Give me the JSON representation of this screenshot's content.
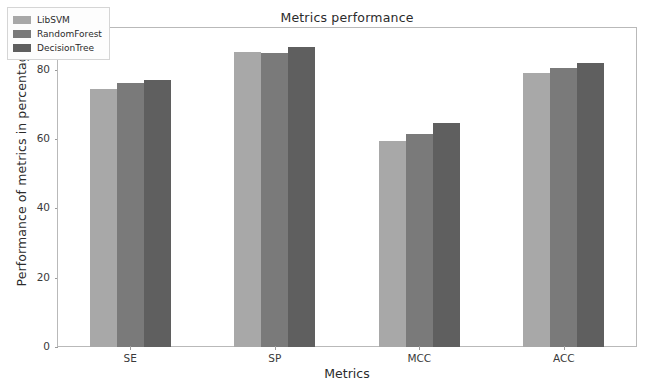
{
  "chart_data": {
    "type": "bar",
    "title": "Metrics performance",
    "xlabel": "Metrics",
    "ylabel": "Performance of metrics in percentage",
    "categories": [
      "SE",
      "SP",
      "MCC",
      "ACC"
    ],
    "series": [
      {
        "name": "LibSVM",
        "color": "#a8a8a8",
        "values": [
          74.5,
          85.0,
          59.5,
          79.0
        ]
      },
      {
        "name": "RandomForest",
        "color": "#7a7a7a",
        "values": [
          76.0,
          84.8,
          61.5,
          80.5
        ]
      },
      {
        "name": "DecisionTree",
        "color": "#5f5f5f",
        "values": [
          77.0,
          86.5,
          64.5,
          81.8
        ]
      }
    ],
    "ylim": [
      0,
      92
    ],
    "yticks": [
      0,
      20,
      40,
      60,
      80
    ],
    "ytick_labels": [
      "0",
      "20",
      "40",
      "60",
      "80"
    ],
    "grid": false,
    "legend_position": "upper left"
  }
}
